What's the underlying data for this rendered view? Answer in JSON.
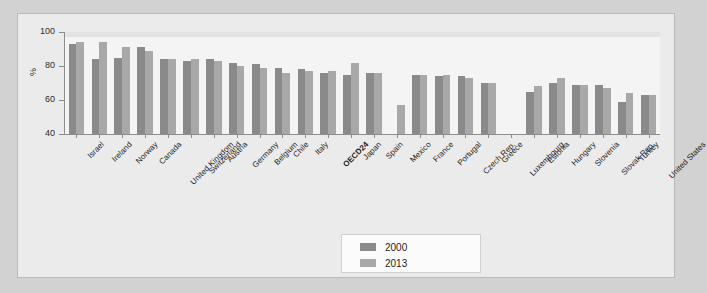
{
  "chart_data": {
    "type": "bar",
    "title": "",
    "subtitle": "",
    "xlabel": "",
    "ylabel": "%",
    "ylim": [
      40,
      100
    ],
    "yticks": [
      40,
      60,
      80,
      100
    ],
    "grid": false,
    "legend_position": "bottom-center",
    "categories": [
      "Israel",
      "Ireland",
      "Norway",
      "Canada",
      "United Kingdom",
      "Switzerland",
      "Austria",
      "Germany",
      "Belgium",
      "Chile",
      "Italy",
      "OECD24",
      "Japan",
      "Spain",
      "Mexico",
      "France",
      "Portugal",
      "Czech Rep.",
      "Greece",
      "Luxembourg",
      "Estonia",
      "Hungary",
      "Slovenia",
      "Slovak Rep.",
      "Turkey",
      "United States"
    ],
    "highlight_category": "OECD24",
    "series": [
      {
        "name": "2000",
        "color": "#8a8a8a",
        "values": [
          93,
          84,
          85,
          91,
          84,
          83,
          84,
          82,
          81,
          79,
          78,
          76,
          75,
          76,
          null,
          75,
          74,
          74,
          70,
          null,
          65,
          70,
          69,
          69,
          59,
          63
        ]
      },
      {
        "name": "2013",
        "color": "#a8a8a8",
        "values": [
          94,
          94,
          91,
          89,
          84,
          84,
          83,
          80,
          79,
          76,
          77,
          77,
          82,
          76,
          57,
          75,
          75,
          73,
          70,
          null,
          68,
          73,
          69,
          67,
          64,
          63
        ]
      }
    ]
  },
  "legend": {
    "items": [
      {
        "label": "2000",
        "color": "#8a8a8a"
      },
      {
        "label": "2013",
        "color": "#a8a8a8"
      }
    ]
  },
  "axis": {
    "y_title": "%",
    "y_tick_labels": [
      "100",
      "80",
      "60",
      "40"
    ]
  }
}
